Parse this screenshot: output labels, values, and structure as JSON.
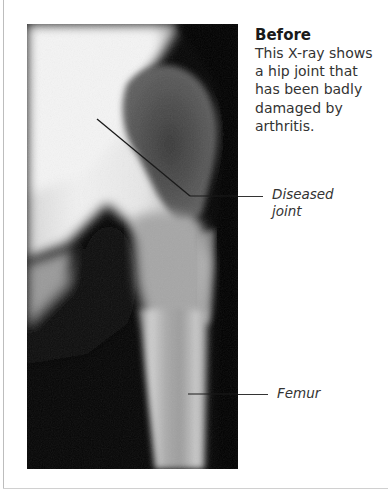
{
  "figure": {
    "image_alt": "X-ray of a hip joint damaged by arthritis",
    "caption": {
      "title": "Before",
      "body": "This X-ray shows a hip joint that has been badly damaged by arthritis."
    },
    "labels": [
      {
        "id": "diseased-joint",
        "text_line1": "Diseased",
        "text_line2": "joint"
      },
      {
        "id": "femur",
        "text_line1": "Femur"
      }
    ]
  }
}
